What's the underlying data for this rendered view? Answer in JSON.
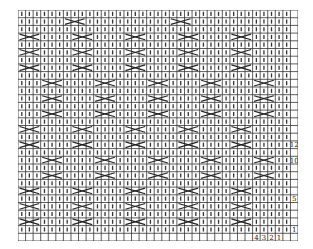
{
  "chart": {
    "columns": 37,
    "rows": 30,
    "legend_note": "I = knit stitch, X = cable crossing (over 2-3 stitches)",
    "row_labels": [
      {
        "row": 1,
        "label": "1"
      },
      {
        "row": 5,
        "label": "5"
      },
      {
        "row": 10,
        "label": "10"
      },
      {
        "row": 12,
        "label": "12"
      }
    ],
    "column_labels": [
      "4",
      "3",
      "2",
      "1"
    ],
    "grid_rows": [
      "IIIIIIIIIIIIIIIIIIIIIIIIIIIIIIIIIII.",
      "IIIIXXIIIIIIIIXXIIIIIIIIIIIIIIIIIII.",
      "IIIIIIIIIIIIIIIIIIIIIIIIIIIIIIIIIII.",
      "XXIIIIIXXIIIIIIXXIIIIIIXXIIIIIIXXII.",
      "IIIIIIIIIIIIIIIIIIIIIIIIIIIIIIIIIII.",
      "XXIIIIIXXIIIIIIXXIIIIIIXXIIIIIIXXII.",
      "IIIIIIIIIIIIIIIIIIIIIIIIIIIIIIIIIII.",
      "XXIIIIIXXIIIIIIXXIIIIIIXXIIIIIIXXII.",
      "IIIIIIIIIIIIIIIIIIIIIIIIIIIIIIIIIII.",
      "IIIIXXIIIIIIXXIIIIIIXXIIIIIIXXIIIII.",
      "IIIIIIIIIIIIIIIIIIIIIIIIIIIIIIIIIII.",
      "IIIIXXIIIIIIXXIIIIIIXXIIIIIIXXIIIII.",
      "IIIIIIIIIIIIIIIIIIIIIIIIIIIIIIIIIII.",
      "IIIIXXIIIIIIXXIIIIIIXXIIIIIIXXIIIII.",
      "IIIIIIIIIIIIIIIIIIIIIIIIIIIIIIIIIII.",
      "XXIIIIIXXIIIIIIXXIIIIIIXXIIIIIIXXII.",
      "IIIIIIIIIIIIIIIIIIIIIIIIIIIIIIIIIII.",
      "XXIIIIIXXIIIIIIXXIIIIIIXXIIIIIIXXII.",
      "IIIIIIIIIIIIIIIIIIIIIIIIIIIIIIIIII.",
      "IIIIXXIIIIIIXXIIIIIIXXIIIIIIXXIIIIIX",
      "IIIIIIIIIIIIIIIIIIIIIIIIIIIIIIIIIIII",
      "IIIIXXIIIIIIXXIIIIIIXXIIIIIIXXIIIII2",
      "IIIIIIIIIIIIIIIIIIIIIIIIIIIIIIIIIII.",
      "XXIIIIIXXIIIIIIXXIIIIIIXXIIIIIIXXII0",
      "IIIIIIIIIIIIIIIIIIIIIIIIIIIIIIIIIII.",
      "XXIIIIIXXIIIIIIXXIIIIIIXXIIIIIIXXII.",
      "IIIIIIIIIIIIIIIIIIIIIIIIIIIIIIIIIII5",
      "XXIIIIIXXIIIIIIXXIIIIIIXXIIIIIIXXII.",
      "IIIIIIIIIIIIIIIIIIIIIIIIIIIIIIIIIII.",
      "XXIIIIIXXIIIIIIXXIIIIIIXXIIIIIIXXII1"
    ]
  }
}
